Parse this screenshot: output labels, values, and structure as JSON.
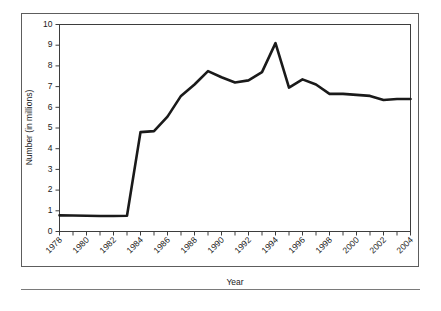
{
  "chart_data": {
    "type": "line",
    "title": "",
    "xlabel": "Year",
    "ylabel": "Number (in millions)",
    "xlim": [
      1978,
      2004
    ],
    "ylim": [
      0,
      10
    ],
    "grid": false,
    "legend": "none",
    "x_tick_labels": [
      "1978",
      "1980",
      "1982",
      "1984",
      "1986",
      "1988",
      "1990",
      "1992",
      "1994",
      "1996",
      "1998",
      "2000",
      "2002",
      "2004"
    ],
    "y_tick_labels": [
      "0",
      "1",
      "2",
      "3",
      "4",
      "5",
      "6",
      "7",
      "8",
      "9",
      "10"
    ],
    "x": [
      1978,
      1979,
      1980,
      1981,
      1982,
      1983,
      1984,
      1985,
      1986,
      1987,
      1988,
      1989,
      1990,
      1991,
      1992,
      1993,
      1994,
      1995,
      1996,
      1997,
      1998,
      1999,
      2000,
      2001,
      2002,
      2003,
      2004
    ],
    "values": [
      0.78,
      0.77,
      0.76,
      0.75,
      0.75,
      0.76,
      4.8,
      4.85,
      5.55,
      6.55,
      7.1,
      7.75,
      7.45,
      7.2,
      7.3,
      7.7,
      9.1,
      6.95,
      7.35,
      7.1,
      6.65,
      6.65,
      6.6,
      6.55,
      6.35,
      6.4,
      6.4
    ],
    "series_name": "Number (in millions)"
  },
  "figure": {
    "y_axis_title": "Number (in millions)",
    "x_axis_title": "Year"
  }
}
